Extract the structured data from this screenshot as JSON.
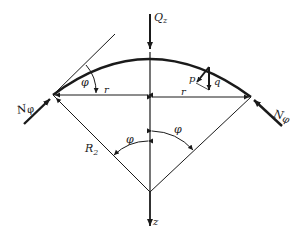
{
  "diagram": {
    "labels": {
      "load_top": "Q",
      "load_top_sub": "z",
      "force_left": "N",
      "force_left_sub": "φ",
      "force_right": "N",
      "force_right_sub": "φ",
      "radius_left": "r",
      "radius_right": "r",
      "meridian_radius": "R",
      "meridian_radius_sub": "2",
      "angle_top_left": "φ",
      "angle_bottom_left": "φ",
      "angle_bottom_right": "φ",
      "component_p": "p",
      "component_q": "q",
      "axis_z": "z"
    },
    "colors": {
      "stroke": "#1a1a1a",
      "background": "#ffffff"
    }
  }
}
